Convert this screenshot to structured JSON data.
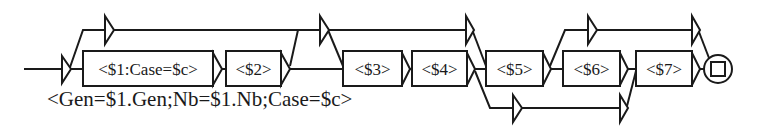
{
  "graph": {
    "boxes": [
      {
        "id": "box1",
        "label": "<$1:Case=$c>"
      },
      {
        "id": "box2",
        "label": "<$2>"
      },
      {
        "id": "box3",
        "label": "<$3>"
      },
      {
        "id": "box4",
        "label": "<$4>"
      },
      {
        "id": "box5",
        "label": "<$5>"
      },
      {
        "id": "box6",
        "label": "<$6>"
      },
      {
        "id": "box7",
        "label": "<$7>"
      }
    ],
    "output": "<Gen=$1.Gen;Nb=$1.Nb;Case=$c>",
    "final_state": "final-state"
  },
  "colors": {
    "stroke": "#1a1a1a",
    "background": "#ffffff"
  }
}
